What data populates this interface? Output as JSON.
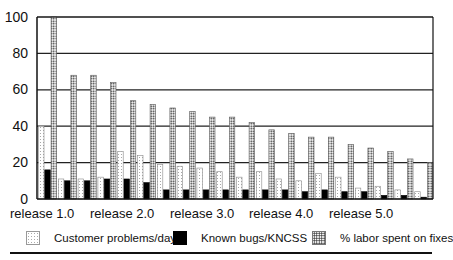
{
  "chart_data": {
    "type": "bar",
    "title": "",
    "xlabel": "",
    "ylabel": "",
    "ylim": [
      0,
      100
    ],
    "yticks": [
      0,
      20,
      40,
      60,
      80,
      100
    ],
    "grid": true,
    "legend_position": "bottom",
    "x_tick_labels": [
      "release 1.0",
      "release 2.0",
      "release 3.0",
      "release 4.0",
      "release 5.0"
    ],
    "categories": [
      "1",
      "2",
      "3",
      "4",
      "5",
      "6",
      "7",
      "8",
      "9",
      "10",
      "11",
      "12",
      "13",
      "14",
      "15",
      "16",
      "17",
      "18",
      "19",
      "20"
    ],
    "series": [
      {
        "name": "Customer problems/day",
        "pattern": "light-dots",
        "values": [
          40,
          11,
          11,
          12,
          26,
          24,
          19,
          18,
          17,
          15,
          12,
          15,
          11,
          10,
          14,
          12,
          6,
          7,
          5,
          4
        ]
      },
      {
        "name": "Known bugs/KNCSS",
        "pattern": "solid-black",
        "values": [
          16,
          10,
          10,
          11,
          11,
          9,
          5,
          5,
          5,
          5,
          5,
          5,
          5,
          4,
          5,
          4,
          4,
          2,
          2,
          1
        ]
      },
      {
        "name": "% labor spent on fixes",
        "pattern": "dense-dots",
        "values": [
          100,
          68,
          68,
          64,
          54,
          52,
          50,
          48,
          45,
          45,
          42,
          38,
          36,
          34,
          34,
          30,
          28,
          26,
          22,
          20
        ]
      }
    ]
  },
  "legend": {
    "customer": "Customer problems/day",
    "bugs": "Known bugs/KNCSS",
    "labor": "% labor spent on fixes"
  },
  "axis": {
    "y0": "0",
    "y20": "20",
    "y40": "40",
    "y60": "60",
    "y80": "80",
    "y100": "100",
    "x0": "release 1.0",
    "x1": "release 2.0",
    "x2": "release 3.0",
    "x3": "release 4.0",
    "x4": "release 5.0"
  }
}
